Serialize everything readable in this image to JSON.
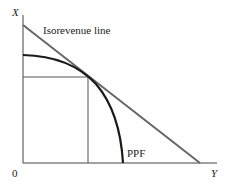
{
  "diagram": {
    "axes": {
      "x_label": "Y",
      "y_label": "X",
      "origin_label": "0"
    },
    "curves": [
      {
        "name": "isorevenue-line",
        "label": "Isorevenue line",
        "color": "#555555"
      },
      {
        "name": "ppf",
        "label": "PPF",
        "color": "#1a1a1a"
      }
    ],
    "tangency_guides": true
  }
}
